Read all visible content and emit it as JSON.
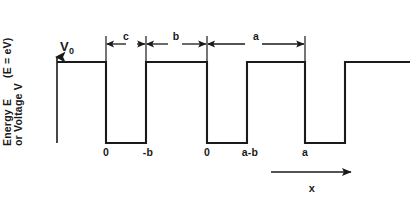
{
  "figure": {
    "axes": {
      "y_units": "(E = eV)",
      "y_label_line1": "Energy E",
      "y_label_line2": "or Voltage V",
      "x_label": "x",
      "top_level_label": "V",
      "top_level_subscript": "0"
    },
    "dimension_labels": [
      {
        "name": "c",
        "text": "c"
      },
      {
        "name": "b",
        "text": "b"
      },
      {
        "name": "a",
        "text": "a"
      }
    ],
    "tick_labels": [
      {
        "name": "origin-1",
        "text": "0"
      },
      {
        "name": "minus-b",
        "text": "-b"
      },
      {
        "name": "origin-2",
        "text": "0"
      },
      {
        "name": "a-minus-b",
        "text": "a-b"
      },
      {
        "name": "a",
        "text": "a"
      }
    ],
    "colors": {
      "line": "#1a1a1a",
      "background": "#ffffff"
    }
  },
  "chart_data": {
    "type": "line",
    "xlabel": "x",
    "ylabel": "Energy E or Voltage V",
    "y_units": "(E = eV)",
    "grid": false,
    "legend": null,
    "xlim": [
      0,
      415
    ],
    "ylim": [
      0,
      1
    ],
    "series": [
      {
        "name": "potential V(x)",
        "comment": "Square wave: high level = V0, low level = 0. Values are px x-coordinates of the step transitions.",
        "levels": {
          "high": "V0",
          "low": "0"
        },
        "points_px": [
          [
            57,
            62
          ],
          [
            106,
            62
          ],
          [
            106,
            143
          ],
          [
            146,
            143
          ],
          [
            146,
            62
          ],
          [
            207,
            62
          ],
          [
            207,
            143
          ],
          [
            247,
            143
          ],
          [
            247,
            62
          ],
          [
            305,
            62
          ],
          [
            305,
            143
          ],
          [
            345,
            143
          ],
          [
            345,
            62
          ],
          [
            410,
            62
          ]
        ]
      }
    ],
    "annotations": [
      {
        "label": "c",
        "type": "dimension",
        "from_px": 106,
        "to_px": 146,
        "y_px": 44,
        "meaning": "barrier width c"
      },
      {
        "label": "b",
        "type": "dimension",
        "from_px": 146,
        "to_px": 207,
        "y_px": 44,
        "meaning": "well width b"
      },
      {
        "label": "a",
        "type": "dimension",
        "from_px": 207,
        "to_px": 305,
        "y_px": 44,
        "meaning": "lattice period a"
      },
      {
        "label": "0",
        "type": "tick",
        "x_px": 106
      },
      {
        "label": "-b",
        "type": "tick",
        "x_px": 146
      },
      {
        "label": "0",
        "type": "tick",
        "x_px": 207
      },
      {
        "label": "a-b",
        "type": "tick",
        "x_px": 247
      },
      {
        "label": "a",
        "type": "tick",
        "x_px": 305
      }
    ]
  }
}
